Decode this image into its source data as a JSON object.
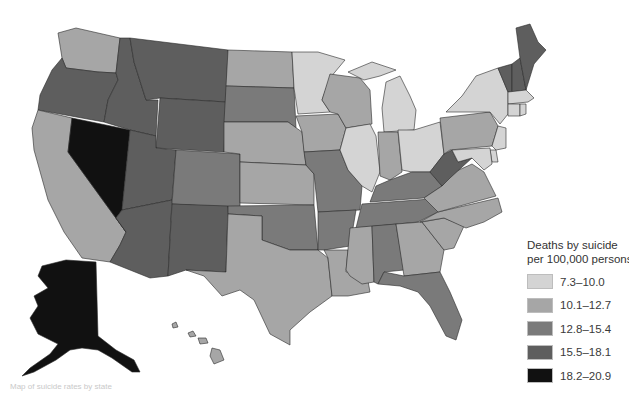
{
  "legend": {
    "title_line1": "Deaths by suicide",
    "title_line2": "per 100,000 persons",
    "classes": [
      {
        "label": "7.3–10.0",
        "color": "#d4d4d4"
      },
      {
        "label": "10.1–12.7",
        "color": "#a6a6a6"
      },
      {
        "label": "12.8–15.4",
        "color": "#7a7a7a"
      },
      {
        "label": "15.5–18.1",
        "color": "#5e5e5e"
      },
      {
        "label": "18.2–20.9",
        "color": "#111111"
      }
    ]
  },
  "map": {
    "type": "choropleth",
    "region": "United States",
    "state_classes": {
      "WA": 1,
      "OR": 3,
      "CA": 1,
      "NV": 4,
      "ID": 3,
      "MT": 3,
      "WY": 3,
      "UT": 3,
      "AZ": 3,
      "CO": 2,
      "NM": 3,
      "ND": 1,
      "SD": 2,
      "NE": 1,
      "KS": 1,
      "OK": 2,
      "TX": 1,
      "MN": 0,
      "IA": 1,
      "MO": 2,
      "AR": 2,
      "LA": 1,
      "WI": 1,
      "IL": 0,
      "MI": 0,
      "IN": 1,
      "OH": 0,
      "KY": 2,
      "TN": 2,
      "MS": 1,
      "AL": 2,
      "GA": 1,
      "FL": 2,
      "SC": 1,
      "NC": 1,
      "VA": 1,
      "WV": 3,
      "PA": 1,
      "NY": 0,
      "VT": 3,
      "NH": 3,
      "ME": 3,
      "MA": 0,
      "CT": 0,
      "RI": 0,
      "NJ": 0,
      "DE": 0,
      "MD": 0,
      "AK": 4,
      "HI": 1
    }
  },
  "caption": "Map of suicide rates by state"
}
